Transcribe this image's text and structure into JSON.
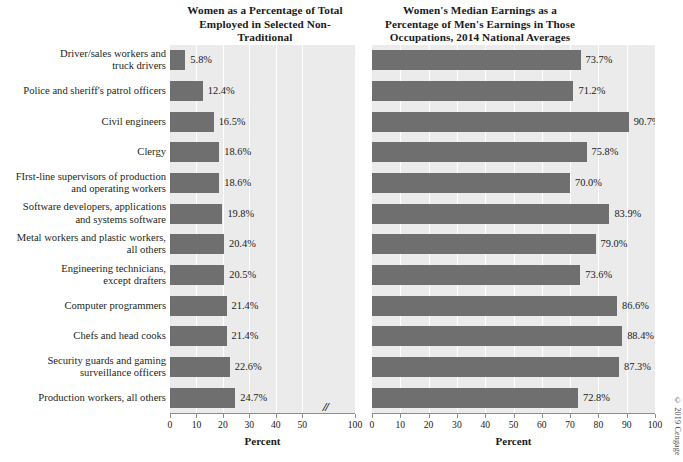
{
  "figure": {
    "credit": "© 2019 Cengage"
  },
  "chart_data": [
    {
      "id": "left",
      "type": "bar",
      "orientation": "horizontal",
      "title": "Women as a Percentage of Total Employed in Selected Non-Traditional Occupations, 2014 National Averages",
      "title_lines": [
        "Women as a Percentage of Total",
        "Employed in Selected Non-Traditional",
        "Occupations, 2014 National Averages"
      ],
      "xlabel": "Percent",
      "ylabel": "",
      "xlim": [
        0,
        100
      ],
      "axis_break": {
        "present": true,
        "after": 50,
        "before": 100,
        "glyph": "//"
      },
      "xticks": [
        0,
        10,
        20,
        30,
        40,
        50,
        100
      ],
      "xtick_labels": [
        "0",
        "10",
        "20",
        "30",
        "40",
        "50",
        "100"
      ],
      "grid": "vertical-white",
      "bar_color": "#6f6f6f",
      "plot_background": "#ebebeb",
      "categories": [
        "Driver/sales workers and truck drivers",
        "Police and sheriff's patrol officers",
        "Civil engineers",
        "Clergy",
        "FIrst-line supervisors of production and operating workers",
        "Software developers, applications and systems software",
        "Metal workers and plastic workers, all others",
        "Engineering technicians, except drafters",
        "Computer programmers",
        "Chefs and head cooks",
        "Security guards and gaming surveillance officers",
        "Production workers, all others"
      ],
      "category_lines": [
        [
          "Driver/sales workers and",
          "truck drivers"
        ],
        [
          "Police and sheriff's patrol officers"
        ],
        [
          "Civil engineers"
        ],
        [
          "Clergy"
        ],
        [
          "FIrst-line supervisors of production",
          "and operating workers"
        ],
        [
          "Software developers, applications",
          "and systems software"
        ],
        [
          "Metal workers and plastic workers,",
          "all others"
        ],
        [
          "Engineering technicians,",
          "except drafters"
        ],
        [
          "Computer programmers"
        ],
        [
          "Chefs and head cooks"
        ],
        [
          "Security guards and gaming",
          "surveillance officers"
        ],
        [
          "Production workers, all others"
        ]
      ],
      "values": [
        5.8,
        12.4,
        16.5,
        18.6,
        18.6,
        19.8,
        20.4,
        20.5,
        21.4,
        21.4,
        22.6,
        24.7
      ],
      "value_labels": [
        "5.8%",
        "12.4%",
        "16.5%",
        "18.6%",
        "18.6%",
        "19.8%",
        "20.4%",
        "20.5%",
        "21.4%",
        "21.4%",
        "22.6%",
        "24.7%"
      ]
    },
    {
      "id": "right",
      "type": "bar",
      "orientation": "horizontal",
      "title": "Women's Median Earnings as a Percentage of Men's Earnings in Those Occupations, 2014 National Averages",
      "title_lines": [
        "Women's Median Earnings as a",
        "Percentage of Men's Earnings in Those",
        "Occupations, 2014 National Averages"
      ],
      "xlabel": "Percent",
      "ylabel": "",
      "xlim": [
        0,
        100
      ],
      "axis_break": {
        "present": false
      },
      "xticks": [
        0,
        10,
        20,
        30,
        40,
        50,
        60,
        70,
        80,
        90,
        100
      ],
      "xtick_labels": [
        "0",
        "10",
        "20",
        "30",
        "40",
        "50",
        "60",
        "70",
        "80",
        "90",
        "100"
      ],
      "grid": "vertical-white",
      "bar_color": "#6f6f6f",
      "plot_background": "#ebebeb",
      "categories": [
        "Driver/sales workers and truck drivers",
        "Police and sheriff's patrol officers",
        "Civil engineers",
        "Clergy",
        "FIrst-line supervisors of production and operating workers",
        "Software developers, applications and systems software",
        "Metal workers and plastic workers, all others",
        "Engineering technicians, except drafters",
        "Computer programmers",
        "Chefs and head cooks",
        "Security guards and gaming surveillance officers",
        "Production workers, all others"
      ],
      "values": [
        73.7,
        71.2,
        90.7,
        75.8,
        70.0,
        83.9,
        79.0,
        73.6,
        86.6,
        88.4,
        87.3,
        72.8
      ],
      "value_labels": [
        "73.7%",
        "71.2%",
        "90.7%",
        "75.8%",
        "70.0%",
        "83.9%",
        "79.0%",
        "73.6%",
        "86.6%",
        "88.4%",
        "87.3%",
        "72.8%"
      ]
    }
  ]
}
